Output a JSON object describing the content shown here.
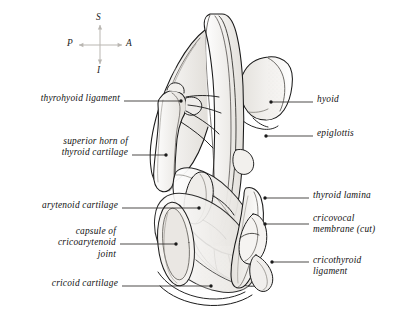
{
  "figure": {
    "background_color": "#ffffff",
    "ink_color": "#1a1a1a",
    "shading_color": "#e9e7e4",
    "leader_color": "#333333"
  },
  "orientation_compass": {
    "name": "anatomical-orientation-compass",
    "superior": "S",
    "inferior": "I",
    "posterior": "P",
    "anterior": "A",
    "center_x": 100,
    "center_y": 45
  },
  "labels_left": [
    {
      "id": "thyrohyoid-ligament",
      "lines": [
        "thyrohyoid  ligament"
      ],
      "text_right_x": 120,
      "text_top_y": 93,
      "leader_x1": 124,
      "leader_y1": 101,
      "leader_x2": 181,
      "leader_y2": 101,
      "dot_x": 181,
      "dot_y": 101
    },
    {
      "id": "superior-horn-of-thyroid-cartilage",
      "lines": [
        "superior horn of",
        "thyroid cartilage"
      ],
      "text_right_x": 128,
      "text_top_y": 136,
      "leader_x1": 132,
      "leader_y1": 155,
      "leader_x2": 166,
      "leader_y2": 155,
      "dot_x": 166,
      "dot_y": 155
    },
    {
      "id": "arytenoid-cartilage",
      "lines": [
        "arytenoid  cartilage"
      ],
      "text_right_x": 118,
      "text_top_y": 200,
      "leader_x1": 122,
      "leader_y1": 208,
      "leader_x2": 199,
      "leader_y2": 208,
      "dot_x": 199,
      "dot_y": 208
    },
    {
      "id": "capsule-of-cricoarytenoid-joint",
      "lines": [
        "capsule of",
        "cricoarytenoid",
        "joint"
      ],
      "text_right_x": 116,
      "text_top_y": 226,
      "leader_x1": 120,
      "leader_y1": 244,
      "leader_x2": 176,
      "leader_y2": 244,
      "dot_x": 176,
      "dot_y": 244
    },
    {
      "id": "cricoid-cartilage",
      "lines": [
        "cricoid  cartilage"
      ],
      "text_right_x": 118,
      "text_top_y": 278,
      "leader_x1": 122,
      "leader_y1": 286,
      "leader_x2": 211,
      "leader_y2": 286,
      "dot_x": 211,
      "dot_y": 286
    }
  ],
  "labels_right": [
    {
      "id": "hyoid",
      "lines": [
        "hyoid"
      ],
      "text_left_x": 317,
      "text_top_y": 94,
      "leader_x1": 313,
      "leader_y1": 102,
      "leader_x2": 271,
      "leader_y2": 102,
      "dot_x": 271,
      "dot_y": 102
    },
    {
      "id": "epiglottis",
      "lines": [
        "epiglottis"
      ],
      "text_left_x": 317,
      "text_top_y": 128,
      "leader_x1": 313,
      "leader_y1": 136,
      "leader_x2": 266,
      "leader_y2": 136,
      "dot_x": 266,
      "dot_y": 136
    },
    {
      "id": "thyroid-lamina",
      "lines": [
        "thyroid  lamina"
      ],
      "text_left_x": 313,
      "text_top_y": 190,
      "leader_x1": 309,
      "leader_y1": 198,
      "leader_x2": 265,
      "leader_y2": 198,
      "dot_x": 265,
      "dot_y": 198
    },
    {
      "id": "cricovocal-membrane-cut",
      "lines": [
        "cricovocal",
        "membrane  (cut)"
      ],
      "text_left_x": 313,
      "text_top_y": 213,
      "leader_x1": 309,
      "leader_y1": 224,
      "leader_x2": 265,
      "leader_y2": 224,
      "dot_x": 265,
      "dot_y": 224
    },
    {
      "id": "cricothyroid-ligament",
      "lines": [
        "cricothyroid",
        "ligament"
      ],
      "text_left_x": 313,
      "text_top_y": 255,
      "leader_x1": 309,
      "leader_y1": 262,
      "leader_x2": 272,
      "leader_y2": 262,
      "dot_x": 272,
      "dot_y": 262
    }
  ],
  "structures": [
    {
      "id": "epiglottis-shape",
      "name": "epiglottis"
    },
    {
      "id": "hyoid-shape",
      "name": "hyoid-bone"
    },
    {
      "id": "thyroid-lamina-shape",
      "name": "thyroid-lamina"
    },
    {
      "id": "superior-horn-shape",
      "name": "superior-horn-of-thyroid-cartilage"
    },
    {
      "id": "arytenoid-shape",
      "name": "arytenoid-cartilage"
    },
    {
      "id": "cricoid-shape",
      "name": "cricoid-cartilage"
    },
    {
      "id": "cricovocal-membrane-shape",
      "name": "cricovocal-membrane"
    },
    {
      "id": "cricothyroid-ligament-shape",
      "name": "cricothyroid-ligament"
    },
    {
      "id": "cricoarytenoid-capsule-shape",
      "name": "capsule-of-cricoarytenoid-joint"
    }
  ]
}
